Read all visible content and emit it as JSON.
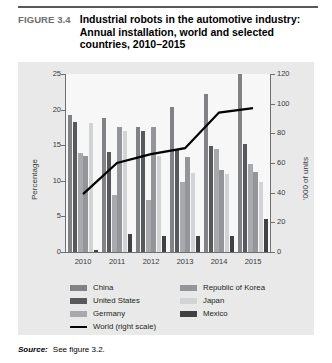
{
  "figure": {
    "label": "FIGURE 3.4",
    "title": "Industrial robots in the automotive industry: Annual installation, world and selected countries, 2010–2015"
  },
  "source": {
    "word": "Source:",
    "text": "See figure 3.2."
  },
  "legend": {
    "column1": [
      {
        "name": "China",
        "color": "#808285"
      },
      {
        "name": "United States",
        "color": "#58595b"
      },
      {
        "name": "Germany",
        "color": "#a7a9ac"
      },
      {
        "name": "World (right scale)",
        "color": "#000000",
        "type": "line"
      }
    ],
    "column2": [
      {
        "name": "Republic of Korea",
        "color": "#939598"
      },
      {
        "name": "Japan",
        "color": "#d1d3d4"
      },
      {
        "name": "Mexico",
        "color": "#414042"
      }
    ]
  },
  "chart_data": {
    "type": "bar",
    "title": "Industrial robots in the automotive industry: Annual installation, world and selected countries, 2010–2015",
    "xlabel": "",
    "ylabel": "Percentage",
    "y2label": "'000 of units",
    "categories": [
      "2010",
      "2011",
      "2012",
      "2013",
      "2014",
      "2015"
    ],
    "ylim": [
      0,
      25
    ],
    "yticks": [
      0,
      5,
      10,
      15,
      20,
      25
    ],
    "y2lim": [
      0,
      120
    ],
    "y2ticks": [
      0,
      20,
      40,
      60,
      80,
      100,
      120
    ],
    "grid": false,
    "legend_position": "bottom",
    "series": [
      {
        "name": "China",
        "color": "#808285",
        "axis": "left",
        "values": [
          19.3,
          18.8,
          17.5,
          20.3,
          22.2,
          26.0
        ]
      },
      {
        "name": "United States",
        "color": "#58595b",
        "axis": "left",
        "values": [
          18.2,
          14.0,
          17.0,
          14.5,
          14.9,
          15.2
        ]
      },
      {
        "name": "Germany",
        "color": "#a7a9ac",
        "axis": "left",
        "values": [
          13.9,
          8.0,
          7.3,
          9.8,
          14.4,
          12.4
        ]
      },
      {
        "name": "Republic of Korea",
        "color": "#939598",
        "axis": "left",
        "values": [
          13.5,
          17.5,
          17.5,
          13.4,
          11.5,
          11.2
        ]
      },
      {
        "name": "Japan",
        "color": "#d1d3d4",
        "axis": "left",
        "values": [
          18.1,
          17.0,
          13.5,
          11.1,
          11.0,
          9.9
        ]
      },
      {
        "name": "Mexico",
        "color": "#414042",
        "axis": "left",
        "values": [
          0.3,
          2.5,
          2.3,
          2.3,
          2.2,
          4.7
        ]
      },
      {
        "name": "World (right scale)",
        "color": "#000000",
        "axis": "right",
        "type": "line",
        "values": [
          39,
          60,
          66,
          70,
          94,
          97
        ]
      }
    ]
  }
}
